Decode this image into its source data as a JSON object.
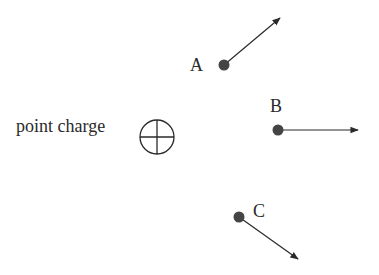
{
  "diagram": {
    "type": "electric-field-vectors",
    "charge": {
      "label": "point charge",
      "symbol": "plus-in-circle",
      "cx": 157,
      "cy": 137,
      "r": 18
    },
    "points": [
      {
        "label": "A",
        "x": 224,
        "y": 65,
        "tip_x": 280,
        "tip_y": 17,
        "label_x": 190,
        "label_y": 71
      },
      {
        "label": "B",
        "x": 278,
        "y": 130,
        "tip_x": 358,
        "tip_y": 131,
        "label_x": 270,
        "label_y": 111
      },
      {
        "label": "C",
        "x": 239,
        "y": 217,
        "tip_x": 298,
        "tip_y": 259,
        "label_x": 253,
        "label_y": 217
      }
    ],
    "colors": {
      "ink": "#2a2a2a",
      "dot": "#444444",
      "background": "#ffffff"
    }
  }
}
